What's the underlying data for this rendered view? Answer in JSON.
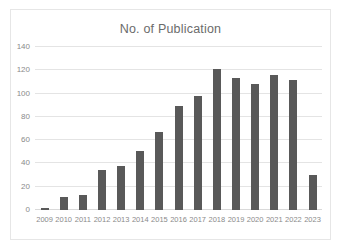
{
  "chart_data": {
    "type": "bar",
    "title": "No. of Publication",
    "xlabel": "",
    "ylabel": "",
    "ylim": [
      0,
      140
    ],
    "yticks": [
      0,
      20,
      40,
      60,
      80,
      100,
      120,
      140
    ],
    "grid": true,
    "legend": false,
    "bar_color": "#595959",
    "gridline_color": "#e4e4e4",
    "categories": [
      "2009",
      "2010",
      "2011",
      "2012",
      "2013",
      "2014",
      "2015",
      "2016",
      "2017",
      "2018",
      "2019",
      "2020",
      "2021",
      "2022",
      "2023"
    ],
    "values": [
      2,
      11,
      13,
      34,
      38,
      51,
      67,
      89,
      98,
      121,
      113,
      108,
      116,
      112,
      30
    ],
    "series": [
      {
        "name": "No. of Publication",
        "values": [
          2,
          11,
          13,
          34,
          38,
          51,
          67,
          89,
          98,
          121,
          113,
          108,
          116,
          112,
          30
        ]
      }
    ]
  }
}
